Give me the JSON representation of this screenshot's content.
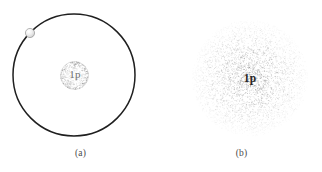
{
  "figure": {
    "background_color": "#ffffff",
    "width": 322,
    "height": 172,
    "panels": [
      {
        "id": "a",
        "caption": "(a)",
        "model_name": "bohr-orbit-model",
        "nucleus_label": "1p",
        "nucleus_label_color": "#6f6f6f",
        "orbit": {
          "center_x": 74,
          "center_y": 75,
          "radius": 61,
          "stroke_color": "#1f1f1f",
          "stroke_width": 1.5
        },
        "nucleus": {
          "center_x": 74.5,
          "center_y": 75.5,
          "radius": 14,
          "stipple_color": "#8a8a8a",
          "dot_count": 520
        },
        "electron": {
          "center_x": 30,
          "center_y": 33,
          "radius": 4.6,
          "fill_color": "#e8e8e8",
          "stroke_color": "#9a9a9a"
        }
      },
      {
        "id": "b",
        "caption": "(b)",
        "model_name": "electron-cloud-model",
        "nucleus_label": "1p",
        "nucleus_label_color": "#262626",
        "cloud": {
          "center_x": 89,
          "center_y": 78,
          "radius": 58,
          "dot_color": "#8c8c8c",
          "dot_count": 4200,
          "density": "highest at center, fading radially outward"
        }
      }
    ]
  }
}
